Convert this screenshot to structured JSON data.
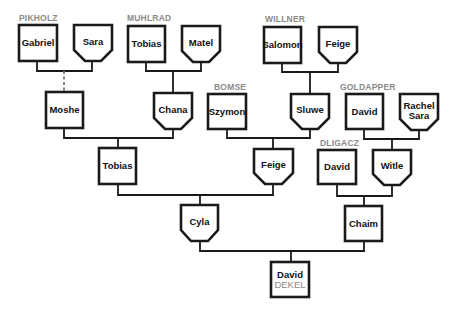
{
  "diagram": {
    "type": "family-tree",
    "colors": {
      "line": "#1a1a1a",
      "family_label": "#8a8a8a",
      "box_fill": "#ffffff"
    },
    "family_labels": [
      {
        "id": "pikholz",
        "text": "PIKHOLZ",
        "x": 19,
        "y": 21
      },
      {
        "id": "muhlrad",
        "text": "MUHLRAD",
        "x": 127,
        "y": 21
      },
      {
        "id": "willner",
        "text": "WILLNER",
        "x": 265,
        "y": 22
      },
      {
        "id": "bomse",
        "text": "BOMSE",
        "x": 214,
        "y": 90
      },
      {
        "id": "goldapper",
        "text": "GOLDAPPER",
        "x": 340,
        "y": 90
      },
      {
        "id": "dligacz",
        "text": "DLIGACZ",
        "x": 320,
        "y": 146
      }
    ],
    "people": [
      {
        "id": "gabriel",
        "name": [
          "Gabriel"
        ],
        "sex": "male",
        "x": 19,
        "y": 25,
        "w": 38,
        "h": 36
      },
      {
        "id": "sara",
        "name": [
          "Sara"
        ],
        "sex": "female",
        "x": 74,
        "y": 25,
        "w": 38,
        "h": 36
      },
      {
        "id": "tobias-muhlrad",
        "name": [
          "Tobias"
        ],
        "sex": "male",
        "x": 128,
        "y": 26,
        "w": 37,
        "h": 36
      },
      {
        "id": "matel",
        "name": [
          "Matel"
        ],
        "sex": "female",
        "x": 182,
        "y": 26,
        "w": 38,
        "h": 36
      },
      {
        "id": "salomon",
        "name": [
          "Salomon"
        ],
        "sex": "male",
        "x": 264,
        "y": 27,
        "w": 37,
        "h": 36
      },
      {
        "id": "feige-willner",
        "name": [
          "Feige"
        ],
        "sex": "female",
        "x": 319,
        "y": 27,
        "w": 38,
        "h": 36
      },
      {
        "id": "moshe",
        "name": [
          "Moshe"
        ],
        "sex": "male",
        "x": 46,
        "y": 92,
        "w": 37,
        "h": 36
      },
      {
        "id": "chana",
        "name": [
          "Chana"
        ],
        "sex": "female",
        "x": 154,
        "y": 93,
        "w": 38,
        "h": 36
      },
      {
        "id": "szymon",
        "name": [
          "Szymon"
        ],
        "sex": "male",
        "x": 208,
        "y": 94,
        "w": 38,
        "h": 35
      },
      {
        "id": "sluwe",
        "name": [
          "Sluwe"
        ],
        "sex": "female",
        "x": 291,
        "y": 94,
        "w": 38,
        "h": 35
      },
      {
        "id": "david-goldapper",
        "name": [
          "David"
        ],
        "sex": "male",
        "x": 346,
        "y": 94,
        "w": 37,
        "h": 35
      },
      {
        "id": "rachel-sara",
        "name": [
          "Rachel",
          "Sara"
        ],
        "sex": "female",
        "x": 400,
        "y": 94,
        "w": 38,
        "h": 36
      },
      {
        "id": "tobias",
        "name": [
          "Tobias"
        ],
        "sex": "male",
        "x": 99,
        "y": 148,
        "w": 37,
        "h": 36
      },
      {
        "id": "feige",
        "name": [
          "Feige"
        ],
        "sex": "female",
        "x": 254,
        "y": 149,
        "w": 39,
        "h": 35
      },
      {
        "id": "david-dligacz",
        "name": [
          "David"
        ],
        "sex": "male",
        "x": 318,
        "y": 150,
        "w": 38,
        "h": 34
      },
      {
        "id": "witle",
        "name": [
          "Witle"
        ],
        "sex": "female",
        "x": 373,
        "y": 150,
        "w": 38,
        "h": 35
      },
      {
        "id": "cyla",
        "name": [
          "Cyla"
        ],
        "sex": "female",
        "x": 181,
        "y": 205,
        "w": 37,
        "h": 36
      },
      {
        "id": "chaim",
        "name": [
          "Chaim"
        ],
        "sex": "male",
        "x": 345,
        "y": 206,
        "w": 37,
        "h": 35
      },
      {
        "id": "david-dekel",
        "name": [
          "David"
        ],
        "surname": "DEKEL",
        "sex": "male",
        "x": 271,
        "y": 262,
        "w": 38,
        "h": 35
      }
    ],
    "links": [
      {
        "from": [
          "gabriel",
          "sara"
        ],
        "to": "moshe",
        "path": "M37 61 V71 H92 V61",
        "down": "M64 71 V92",
        "dashed": true
      },
      {
        "from": [
          "tobias-muhlrad",
          "matel"
        ],
        "to": "chana",
        "path": "M146 62 V71 H201 V62",
        "down": "M173 71 V93",
        "dashed": false
      },
      {
        "from": [
          "salomon",
          "feige-willner"
        ],
        "to": "sluwe",
        "path": "M282 63 V72 H338 V63",
        "down": "M310 72 V94",
        "dashed": false
      },
      {
        "from": [
          "moshe",
          "chana"
        ],
        "to": "tobias",
        "path": "M64 128 V138 H173 V129",
        "down": "M118 138 V148",
        "dashed": false
      },
      {
        "from": [
          "szymon",
          "sluwe"
        ],
        "to": "feige",
        "path": "M227 129 V138 H310 V129",
        "down": "M273 138 V149",
        "dashed": false
      },
      {
        "from": [
          "david-goldapper",
          "rachel-sara"
        ],
        "to": "witle",
        "path": "M364 129 V139 H419 V130",
        "down": "M392 139 V150",
        "dashed": false
      },
      {
        "from": [
          "tobias",
          "feige"
        ],
        "to": "cyla",
        "path": "M118 184 V195 H273 V184",
        "down": "M200 195 V205",
        "dashed": false
      },
      {
        "from": [
          "david-dligacz",
          "witle"
        ],
        "to": "chaim",
        "path": "M337 184 V196 H392 V185",
        "down": "M364 196 V206",
        "dashed": false
      },
      {
        "from": [
          "cyla",
          "chaim"
        ],
        "to": "david-dekel",
        "path": "M200 241 V251 H364 V241",
        "down": "M291 251 V262",
        "dashed": false
      }
    ]
  }
}
